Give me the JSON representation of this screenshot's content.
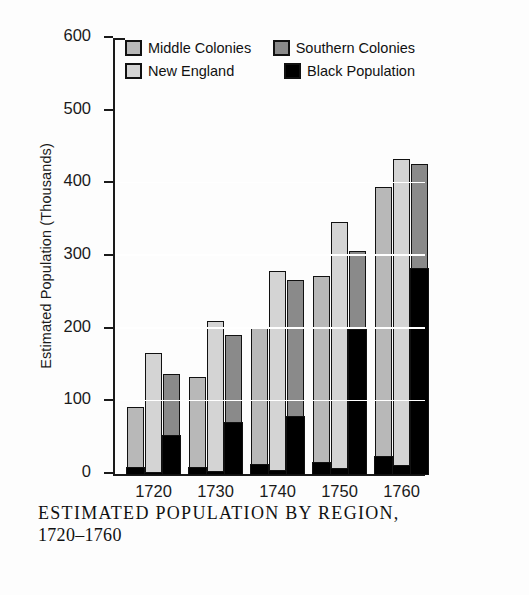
{
  "chart_data": {
    "type": "bar",
    "title": "ESTIMATED POPULATION BY REGION, 1720–1760",
    "subtitle": "",
    "xlabel": "",
    "ylabel": "Estimated Population (Thousands)",
    "categories": [
      "1720",
      "1730",
      "1740",
      "1750",
      "1760"
    ],
    "ylim": [
      0,
      600
    ],
    "yticks": [
      0,
      100,
      200,
      300,
      400,
      500,
      600
    ],
    "ytick_labels": [
      "0",
      "100",
      "200",
      "300",
      "400",
      "500",
      "600"
    ],
    "grid": "white horizontal gridlines at 100, 200, 300, 400 drawn over bars",
    "legend_position": "top, inside plot area, two columns",
    "grouping": "grouped bars per decade; each bar has a Black Population segment stacked at its base",
    "series": [
      {
        "name": "Middle Colonies",
        "color": "#b8b8b8",
        "values": [
          92,
          134,
          202,
          273,
          395
        ]
      },
      {
        "name": "New England",
        "color": "#d4d4d4",
        "values": [
          166,
          211,
          280,
          347,
          433
        ]
      },
      {
        "name": "Southern Colonies",
        "color": "#8a8a8a",
        "values": [
          138,
          191,
          267,
          307,
          427
        ]
      },
      {
        "name": "Black Population",
        "color": "#000000",
        "values_by_bar": {
          "middle_colonies": [
            11,
            11,
            14,
            18,
            26
          ],
          "new_england": [
            4,
            5,
            7,
            9,
            13
          ],
          "southern_colonies": [
            54,
            72,
            80,
            200,
            285
          ]
        }
      }
    ]
  },
  "legend": {
    "items": [
      {
        "label": "Middle Colonies",
        "swatch": "#b8b8b8"
      },
      {
        "label": "Southern Colonies",
        "swatch": "#8a8a8a"
      },
      {
        "label": "New England",
        "swatch": "#d4d4d4"
      },
      {
        "label": "Black Population",
        "swatch": "#000000"
      }
    ]
  },
  "caption": {
    "line1": "ESTIMATED POPULATION BY REGION,",
    "line2": "1720–1760"
  }
}
